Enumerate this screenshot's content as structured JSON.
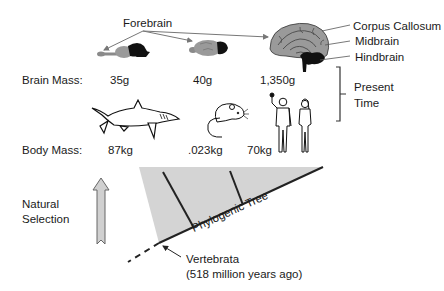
{
  "diagram": {
    "labels": {
      "forebrain": "Forebrain",
      "corpus_callosum": "Corpus Callosum",
      "midbrain": "Midbrain",
      "hindbrain": "Hindbrain",
      "brain_mass": "Brain Mass:",
      "body_mass": "Body Mass:",
      "present_time_1": "Present",
      "present_time_2": "Time",
      "natural_selection_1": "Natural",
      "natural_selection_2": "Selection",
      "phylogenic_tree": "Phylogenic Tree",
      "vertebrata": "Vertebrata",
      "vertebrata_age": "(518 million years ago)"
    },
    "organisms": [
      {
        "name": "shark",
        "brain_mass": "35g",
        "body_mass": "87kg"
      },
      {
        "name": "rat",
        "brain_mass": "40g",
        "body_mass": ".023kg"
      },
      {
        "name": "human",
        "brain_mass": "1,350g",
        "body_mass": "70kg"
      }
    ],
    "colors": {
      "tree_fill": "#d4d4d4",
      "line": "#222222",
      "brain_gray": "#9a9a9a",
      "brain_dark": "#111111",
      "arrow_fill": "#d0d0d0",
      "pointer": "#777777"
    }
  }
}
